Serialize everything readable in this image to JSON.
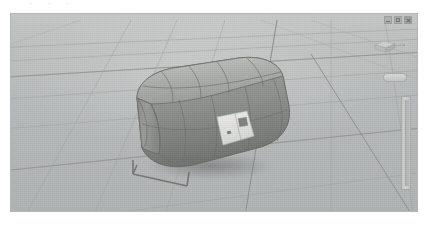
{
  "app": {
    "kind": "3d-modeling-viewport",
    "title": "",
    "background_color": "#ffffff"
  },
  "viewport": {
    "name": "perspective-viewport",
    "background_color": "#b9bcbb",
    "grid_line_color": "#9a9d9c",
    "grid_major_line_color": "#848786",
    "projection": "perspective",
    "shading_mode": "shaded-with-wireframe"
  },
  "window_controls": {
    "minimize_label": "",
    "maximize_label": "",
    "close_label": "",
    "minimize_icon": "minimize-icon",
    "maximize_icon": "maximize-icon",
    "close_icon": "close-icon"
  },
  "navigation": {
    "viewcube_icon": "viewcube-icon",
    "axis_label": "",
    "mini_button_label": "",
    "slider_name": "zoom-slider",
    "slider_value": ""
  },
  "model": {
    "name": "rounded-box-tank",
    "description": "rounded rectangular box / tank body with filleted edges and quad wireframe subdivisions",
    "body_color": "#9a9d9a",
    "body_highlight_color": "#c0c3bf",
    "body_shadow_color": "#6c6f6c",
    "wire_color": "#6a6d6a",
    "panel": {
      "name": "face-panel-label",
      "color": "#e7e8e4",
      "detail_color": "#8e918e"
    },
    "stand": {
      "name": "support-stand",
      "color": "#7d807d"
    }
  },
  "top_remnants": [
    {
      "text": "·",
      "x": 30
    },
    {
      "text": "·",
      "x": 48
    },
    {
      "text": "·",
      "x": 66
    }
  ]
}
